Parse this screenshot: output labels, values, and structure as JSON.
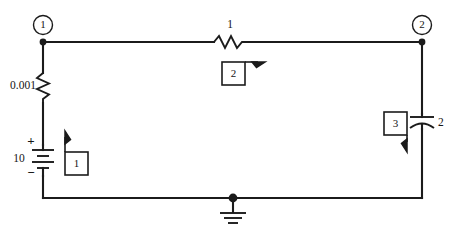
{
  "diagram": {
    "type": "circuit-schematic",
    "background_color": "#ffffff",
    "line_color": "#1b1b1b"
  },
  "nodes": [
    {
      "id": "node-1",
      "label": "1",
      "x": 43,
      "y": 25
    },
    {
      "id": "node-2",
      "label": "2",
      "x": 422,
      "y": 25
    }
  ],
  "components": {
    "source": {
      "kind": "dc-voltage-source-battery",
      "value": "10",
      "plus_sign": "+",
      "minus_sign": "−"
    },
    "resistor_left": {
      "kind": "resistor",
      "value": "0.001"
    },
    "resistor_top": {
      "kind": "resistor",
      "value": "1"
    },
    "capacitor_right": {
      "kind": "capacitor",
      "value": "2"
    },
    "ground": {
      "kind": "ground",
      "label": ""
    }
  },
  "mesh_boxes": [
    {
      "id": "mesh-1",
      "label": "1",
      "arrow_direction": "up"
    },
    {
      "id": "mesh-2",
      "label": "2",
      "arrow_direction": "right"
    },
    {
      "id": "mesh-3",
      "label": "3",
      "arrow_direction": "down"
    }
  ]
}
